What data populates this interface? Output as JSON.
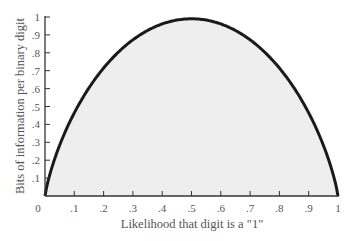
{
  "chart_data": {
    "type": "area",
    "title": "",
    "xlabel": "Likelihood that digit is a \"1\"",
    "ylabel": "Bits of information per binary digit",
    "xlim": [
      0,
      1
    ],
    "ylim": [
      0,
      1
    ],
    "grid": false,
    "legend": null,
    "x_ticks": [
      "0",
      ".1",
      ".2",
      ".3",
      ".4",
      ".5",
      ".6",
      ".7",
      ".8",
      ".9",
      "1"
    ],
    "y_ticks": [
      "0",
      ".1",
      ".2",
      ".3",
      ".4",
      ".5",
      ".6",
      ".7",
      ".8",
      ".9",
      "1"
    ],
    "x": [
      0,
      0.05,
      0.1,
      0.2,
      0.3,
      0.4,
      0.5,
      0.6,
      0.7,
      0.8,
      0.9,
      0.95,
      1
    ],
    "series": [
      {
        "name": "Binary entropy",
        "values": [
          0,
          0.29,
          0.47,
          0.72,
          0.88,
          0.97,
          1.0,
          0.97,
          0.88,
          0.72,
          0.47,
          0.29,
          0
        ],
        "line_color": "#1a1a1a",
        "fill_color": "#eeeeee"
      }
    ]
  }
}
